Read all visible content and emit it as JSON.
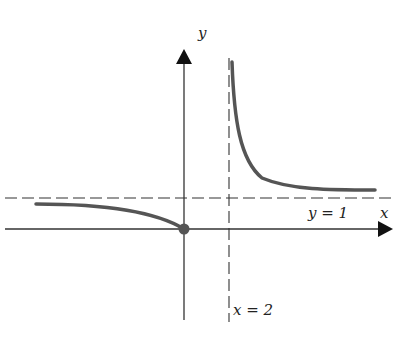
{
  "diagram": {
    "function": "y = x/(x-2)",
    "axes": {
      "x_label": "x",
      "y_label": "y"
    },
    "asymptotes": {
      "vertical": {
        "label": "x = 2",
        "value": 2
      },
      "horizontal": {
        "label": "y = 1",
        "value": 1
      }
    },
    "point": {
      "x": 0,
      "y": 0
    },
    "colors": {
      "curve": "#555555",
      "axis": "#222222"
    }
  }
}
